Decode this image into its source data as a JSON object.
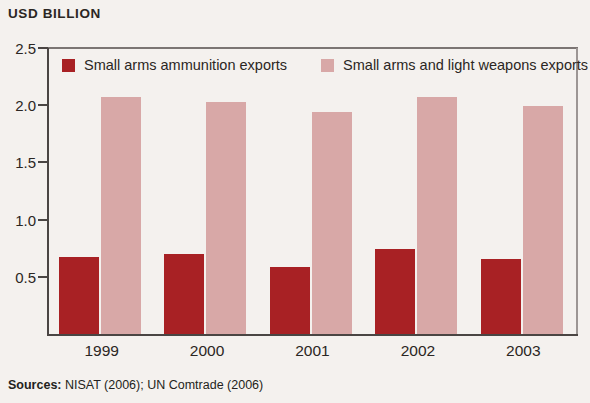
{
  "axis_title": "USD BILLION",
  "sources": {
    "label": "Sources:",
    "text": " NISAT (2006); UN Comtrade (2006)"
  },
  "colors": {
    "series_dark": "#a82124",
    "series_light": "#d8a8a7",
    "axis": "#4a4543",
    "background": "#f4f1ee"
  },
  "chart_data": {
    "type": "bar",
    "title": "",
    "subtitle": "",
    "xlabel": "",
    "ylabel": "USD BILLION",
    "ylim": [
      0,
      2.5
    ],
    "yticks": [
      "0.5",
      "1.0",
      "1.5",
      "2.0",
      "2.5"
    ],
    "ytick_values": [
      0.5,
      1.0,
      1.5,
      2.0,
      2.5
    ],
    "grid": false,
    "legend_position": "top-inside",
    "categories": [
      "1999",
      "2000",
      "2001",
      "2002",
      "2003"
    ],
    "series": [
      {
        "name": "Small arms ammunition exports",
        "color": "#a82124",
        "values": [
          0.67,
          0.7,
          0.59,
          0.74,
          0.66
        ]
      },
      {
        "name": "Small arms and light weapons exports",
        "color": "#d8a8a7",
        "values": [
          2.07,
          2.03,
          1.94,
          2.07,
          1.99
        ]
      }
    ]
  }
}
